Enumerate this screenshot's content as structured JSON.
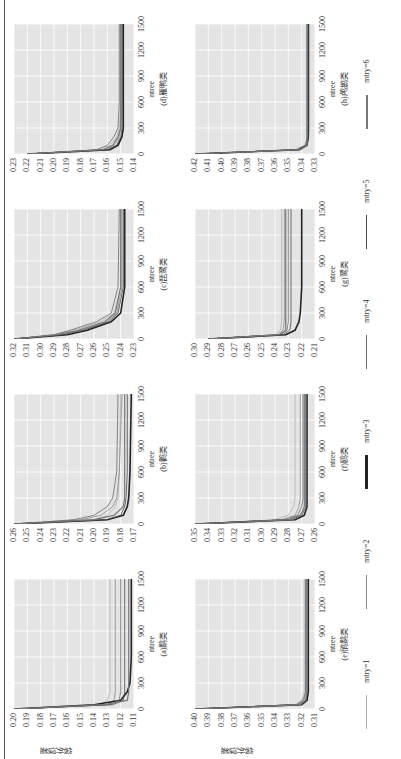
{
  "figure": {
    "ylabel": "袋外误差",
    "xlabel": "ntree",
    "legend": [
      {
        "label": "mtry=1",
        "color": "#b0b0b0",
        "width": 1
      },
      {
        "label": "mtry=2",
        "color": "#8a8a8a",
        "width": 1
      },
      {
        "label": "mtry=3",
        "color": "#222222",
        "width": 3
      },
      {
        "label": "mtry=4",
        "color": "#6a6a6a",
        "width": 1
      },
      {
        "label": "mtry=5",
        "color": "#4a4a4a",
        "width": 1
      },
      {
        "label": "mtry=6",
        "color": "#777777",
        "width": 2
      }
    ]
  },
  "panels": [
    {
      "title": "(a)鹬类",
      "yticks": [
        "0.20",
        "0.19",
        "0.18",
        "0.17",
        "0.16",
        "0.15",
        "0.14",
        "0.13",
        "0.12",
        "0.11"
      ],
      "xticks": [
        "0",
        "300",
        "600",
        "900",
        "1200",
        "1500"
      ]
    },
    {
      "title": "(b)鹳类",
      "yticks": [
        "0.26",
        "0.25",
        "0.24",
        "0.23",
        "0.22",
        "0.21",
        "0.20",
        "0.19",
        "0.18",
        "0.17"
      ],
      "xticks": [
        "0",
        "300",
        "600",
        "900",
        "1200",
        "1500"
      ]
    },
    {
      "title": "(c)琵鹭类",
      "yticks": [
        "0.32",
        "0.31",
        "0.30",
        "0.29",
        "0.28",
        "0.27",
        "0.26",
        "0.25",
        "0.24",
        "0.23"
      ],
      "xticks": [
        "0",
        "300",
        "600",
        "900",
        "1200",
        "1500"
      ]
    },
    {
      "title": "(d)雁鸭类",
      "yticks": [
        "0.23",
        "0.22",
        "0.21",
        "0.20",
        "0.19",
        "0.18",
        "0.17",
        "0.16",
        "0.15",
        "0.14"
      ],
      "xticks": [
        "0",
        "300",
        "600",
        "900",
        "1200",
        "1500"
      ]
    },
    {
      "title": "(e)鸻鹬类",
      "yticks": [
        "0.40",
        "0.39",
        "0.38",
        "0.37",
        "0.36",
        "0.35",
        "0.34",
        "0.33",
        "0.32",
        "0.31"
      ],
      "xticks": [
        "0",
        "300",
        "600",
        "900",
        "1200",
        "1500"
      ]
    },
    {
      "title": "(f)鸥类",
      "yticks": [
        "0.35",
        "0.34",
        "0.33",
        "0.32",
        "0.31",
        "0.30",
        "0.29",
        "0.28",
        "0.27",
        "0.26"
      ],
      "xticks": [
        "0",
        "300",
        "600",
        "900",
        "1200",
        "1500"
      ]
    },
    {
      "title": "(g)鹭类",
      "yticks": [
        "0.30",
        "0.29",
        "0.28",
        "0.27",
        "0.26",
        "0.25",
        "0.24",
        "0.23",
        "0.22",
        "0.21"
      ],
      "xticks": [
        "0",
        "300",
        "600",
        "900",
        "1200",
        "1500"
      ]
    },
    {
      "title": "(h)鸬鹚类",
      "yticks": [
        "0.42",
        "0.41",
        "0.40",
        "0.39",
        "0.38",
        "0.37",
        "0.36",
        "0.35",
        "0.34",
        "0.33"
      ],
      "xticks": [
        "0",
        "300",
        "600",
        "900",
        "1200",
        "1500"
      ]
    }
  ],
  "chart_data": [
    {
      "type": "line",
      "title": "(a)鹬类",
      "xlabel": "ntree",
      "ylabel": "袋外误差",
      "xlim": [
        0,
        1500
      ],
      "ylim": [
        0.11,
        0.2
      ],
      "grid": true,
      "x": [
        0,
        50,
        100,
        200,
        300,
        600,
        1500
      ],
      "series": [
        {
          "name": "mtry=1",
          "values": [
            0.2,
            0.135,
            0.13,
            0.128,
            0.128,
            0.128,
            0.128
          ]
        },
        {
          "name": "mtry=2",
          "values": [
            0.2,
            0.13,
            0.125,
            0.124,
            0.124,
            0.124,
            0.124
          ]
        },
        {
          "name": "mtry=3",
          "values": [
            0.2,
            0.14,
            0.12,
            0.115,
            0.113,
            0.112,
            0.112
          ]
        },
        {
          "name": "mtry=4",
          "values": [
            0.2,
            0.128,
            0.121,
            0.12,
            0.12,
            0.12,
            0.12
          ]
        },
        {
          "name": "mtry=5",
          "values": [
            0.2,
            0.126,
            0.118,
            0.117,
            0.117,
            0.117,
            0.117
          ]
        },
        {
          "name": "mtry=6",
          "values": [
            0.2,
            0.132,
            0.115,
            0.114,
            0.114,
            0.114,
            0.114
          ]
        }
      ]
    },
    {
      "type": "line",
      "title": "(b)鹳类",
      "xlabel": "ntree",
      "ylabel": "袋外误差",
      "xlim": [
        0,
        1500
      ],
      "ylim": [
        0.17,
        0.26
      ],
      "grid": true,
      "x": [
        0,
        50,
        100,
        200,
        300,
        600,
        1500
      ],
      "series": [
        {
          "name": "mtry=1",
          "values": [
            0.26,
            0.2,
            0.19,
            0.184,
            0.182,
            0.181,
            0.18
          ]
        },
        {
          "name": "mtry=2",
          "values": [
            0.26,
            0.21,
            0.195,
            0.186,
            0.183,
            0.181,
            0.179
          ]
        },
        {
          "name": "mtry=3",
          "values": [
            0.26,
            0.19,
            0.178,
            0.175,
            0.174,
            0.173,
            0.172
          ]
        },
        {
          "name": "mtry=4",
          "values": [
            0.26,
            0.215,
            0.2,
            0.19,
            0.186,
            0.183,
            0.182
          ]
        },
        {
          "name": "mtry=5",
          "values": [
            0.26,
            0.19,
            0.18,
            0.177,
            0.176,
            0.175,
            0.175
          ]
        },
        {
          "name": "mtry=6",
          "values": [
            0.26,
            0.2,
            0.185,
            0.178,
            0.177,
            0.177,
            0.177
          ]
        }
      ]
    },
    {
      "type": "line",
      "title": "(c)琵鹭类",
      "xlabel": "ntree",
      "ylabel": "袋外误差",
      "xlim": [
        0,
        1500
      ],
      "ylim": [
        0.23,
        0.32
      ],
      "grid": true,
      "x": [
        0,
        50,
        100,
        200,
        300,
        600,
        1500
      ],
      "series": [
        {
          "name": "mtry=1",
          "values": [
            0.32,
            0.29,
            0.275,
            0.255,
            0.245,
            0.24,
            0.24
          ]
        },
        {
          "name": "mtry=2",
          "values": [
            0.32,
            0.285,
            0.27,
            0.25,
            0.243,
            0.239,
            0.239
          ]
        },
        {
          "name": "mtry=3",
          "values": [
            0.32,
            0.28,
            0.265,
            0.247,
            0.24,
            0.237,
            0.237
          ]
        },
        {
          "name": "mtry=4",
          "values": [
            0.32,
            0.29,
            0.278,
            0.258,
            0.247,
            0.242,
            0.241
          ]
        },
        {
          "name": "mtry=5",
          "values": [
            0.32,
            0.283,
            0.268,
            0.249,
            0.242,
            0.238,
            0.238
          ]
        },
        {
          "name": "mtry=6",
          "values": [
            0.32,
            0.287,
            0.272,
            0.252,
            0.244,
            0.24,
            0.24
          ]
        }
      ]
    },
    {
      "type": "line",
      "title": "(d)雁鸭类",
      "xlabel": "ntree",
      "ylabel": "袋外误差",
      "xlim": [
        0,
        1500
      ],
      "ylim": [
        0.14,
        0.23
      ],
      "grid": true,
      "x": [
        0,
        50,
        100,
        200,
        300,
        600,
        1500
      ],
      "series": [
        {
          "name": "mtry=1",
          "values": [
            0.22,
            0.165,
            0.158,
            0.153,
            0.151,
            0.15,
            0.15
          ]
        },
        {
          "name": "mtry=2",
          "values": [
            0.22,
            0.162,
            0.155,
            0.151,
            0.15,
            0.149,
            0.149
          ]
        },
        {
          "name": "mtry=3",
          "values": [
            0.22,
            0.158,
            0.152,
            0.149,
            0.148,
            0.148,
            0.148
          ]
        },
        {
          "name": "mtry=4",
          "values": [
            0.22,
            0.168,
            0.16,
            0.155,
            0.152,
            0.151,
            0.151
          ]
        },
        {
          "name": "mtry=5",
          "values": [
            0.22,
            0.16,
            0.153,
            0.15,
            0.149,
            0.149,
            0.149
          ]
        },
        {
          "name": "mtry=6",
          "values": [
            0.22,
            0.163,
            0.156,
            0.152,
            0.15,
            0.15,
            0.15
          ]
        }
      ]
    },
    {
      "type": "line",
      "title": "(e)鸻鹬类",
      "xlabel": "ntree",
      "ylabel": "袋外误差",
      "xlim": [
        0,
        1500
      ],
      "ylim": [
        0.31,
        0.4
      ],
      "grid": true,
      "x": [
        0,
        50,
        100,
        200,
        300,
        600,
        1500
      ],
      "series": [
        {
          "name": "mtry=1",
          "values": [
            0.4,
            0.325,
            0.32,
            0.318,
            0.318,
            0.318,
            0.318
          ]
        },
        {
          "name": "mtry=2",
          "values": [
            0.4,
            0.323,
            0.318,
            0.317,
            0.317,
            0.317,
            0.317
          ]
        },
        {
          "name": "mtry=3",
          "values": [
            0.4,
            0.32,
            0.316,
            0.315,
            0.315,
            0.315,
            0.315
          ]
        },
        {
          "name": "mtry=4",
          "values": [
            0.4,
            0.324,
            0.319,
            0.317,
            0.317,
            0.317,
            0.317
          ]
        },
        {
          "name": "mtry=5",
          "values": [
            0.4,
            0.322,
            0.317,
            0.316,
            0.316,
            0.316,
            0.316
          ]
        },
        {
          "name": "mtry=6",
          "values": [
            0.4,
            0.321,
            0.317,
            0.316,
            0.316,
            0.316,
            0.316
          ]
        }
      ]
    },
    {
      "type": "line",
      "title": "(f)鸥类",
      "xlabel": "ntree",
      "ylabel": "袋外误差",
      "xlim": [
        0,
        1500
      ],
      "ylim": [
        0.26,
        0.35
      ],
      "grid": true,
      "x": [
        0,
        50,
        100,
        200,
        300,
        600,
        1500
      ],
      "series": [
        {
          "name": "mtry=1",
          "values": [
            0.35,
            0.29,
            0.28,
            0.276,
            0.275,
            0.275,
            0.275
          ]
        },
        {
          "name": "mtry=2",
          "values": [
            0.35,
            0.285,
            0.275,
            0.272,
            0.271,
            0.271,
            0.271
          ]
        },
        {
          "name": "mtry=3",
          "values": [
            0.35,
            0.275,
            0.268,
            0.266,
            0.266,
            0.266,
            0.266
          ]
        },
        {
          "name": "mtry=4",
          "values": [
            0.35,
            0.283,
            0.273,
            0.27,
            0.269,
            0.269,
            0.269
          ]
        },
        {
          "name": "mtry=5",
          "values": [
            0.35,
            0.28,
            0.271,
            0.268,
            0.268,
            0.268,
            0.268
          ]
        },
        {
          "name": "mtry=6",
          "values": [
            0.35,
            0.278,
            0.27,
            0.267,
            0.267,
            0.267,
            0.267
          ]
        }
      ]
    },
    {
      "type": "line",
      "title": "(g)鹭类",
      "xlabel": "ntree",
      "ylabel": "袋外误差",
      "xlim": [
        0,
        1500
      ],
      "ylim": [
        0.21,
        0.3
      ],
      "grid": true,
      "x": [
        0,
        50,
        100,
        200,
        300,
        600,
        1500
      ],
      "series": [
        {
          "name": "mtry=1",
          "values": [
            0.29,
            0.24,
            0.236,
            0.235,
            0.235,
            0.235,
            0.235
          ]
        },
        {
          "name": "mtry=2",
          "values": [
            0.29,
            0.238,
            0.234,
            0.233,
            0.233,
            0.233,
            0.233
          ]
        },
        {
          "name": "mtry=3",
          "values": [
            0.29,
            0.232,
            0.225,
            0.222,
            0.221,
            0.22,
            0.22
          ]
        },
        {
          "name": "mtry=4",
          "values": [
            0.29,
            0.236,
            0.231,
            0.23,
            0.23,
            0.23,
            0.23
          ]
        },
        {
          "name": "mtry=5",
          "values": [
            0.29,
            0.234,
            0.229,
            0.228,
            0.228,
            0.228,
            0.228
          ]
        },
        {
          "name": "mtry=6",
          "values": [
            0.29,
            0.237,
            0.232,
            0.232,
            0.232,
            0.232,
            0.232
          ]
        }
      ]
    },
    {
      "type": "line",
      "title": "(h)鸬鹚类",
      "xlabel": "ntree",
      "ylabel": "袋外误差",
      "xlim": [
        0,
        1500
      ],
      "ylim": [
        0.33,
        0.42
      ],
      "grid": true,
      "x": [
        0,
        50,
        100,
        200,
        300,
        600,
        1500
      ],
      "series": [
        {
          "name": "mtry=1",
          "values": [
            0.42,
            0.345,
            0.338,
            0.335,
            0.334,
            0.334,
            0.334
          ]
        },
        {
          "name": "mtry=2",
          "values": [
            0.42,
            0.343,
            0.337,
            0.335,
            0.335,
            0.335,
            0.335
          ]
        },
        {
          "name": "mtry=3",
          "values": [
            0.42,
            0.342,
            0.336,
            0.335,
            0.335,
            0.335,
            0.335
          ]
        },
        {
          "name": "mtry=4",
          "values": [
            0.42,
            0.344,
            0.337,
            0.336,
            0.336,
            0.336,
            0.336
          ]
        },
        {
          "name": "mtry=5",
          "values": [
            0.42,
            0.342,
            0.336,
            0.335,
            0.335,
            0.335,
            0.335
          ]
        },
        {
          "name": "mtry=6",
          "values": [
            0.42,
            0.341,
            0.336,
            0.336,
            0.336,
            0.336,
            0.336
          ]
        }
      ]
    }
  ]
}
